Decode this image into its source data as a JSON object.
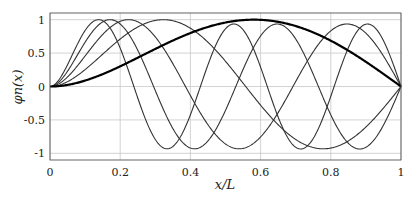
{
  "chart_data": {
    "type": "line",
    "title": "",
    "xlabel": "x/L",
    "ylabel": "φn(x)",
    "xlim": [
      0,
      1
    ],
    "ylim": [
      -1.1,
      1.1
    ],
    "xticks": [
      0,
      0.2,
      0.4,
      0.6,
      0.8,
      1
    ],
    "xtick_labels": [
      "0",
      "0.2",
      "0.4",
      "0.6",
      "0.8",
      "1"
    ],
    "yticks": [
      -1,
      -0.5,
      0,
      0.5,
      1
    ],
    "ytick_labels": [
      "-1",
      "-0.5",
      "0",
      "0.5",
      "1"
    ],
    "grid": true,
    "legend": null,
    "x": [
      0,
      0.1,
      0.2,
      0.3,
      0.4,
      0.5,
      0.6,
      0.7,
      0.8,
      0.9,
      1.0
    ],
    "series": [
      {
        "name": "mode 1",
        "beta": 3.9266,
        "bold": true,
        "values": [
          0,
          0.06,
          0.22,
          0.45,
          0.69,
          0.88,
          0.99,
          0.97,
          0.8,
          0.47,
          0
        ]
      },
      {
        "name": "mode 2",
        "beta": 7.0686,
        "bold": false,
        "values": [
          0,
          0.18,
          0.62,
          0.97,
          0.92,
          0.42,
          -0.29,
          -0.83,
          -0.97,
          -0.64,
          0
        ]
      },
      {
        "name": "mode 3",
        "beta": 10.2102,
        "bold": false,
        "values": [
          0,
          0.38,
          0.98,
          0.7,
          -0.25,
          -0.93,
          -0.75,
          0.1,
          0.86,
          0.82,
          0
        ]
      },
      {
        "name": "mode 4",
        "beta": 13.3518,
        "bold": false,
        "values": [
          0,
          0.6,
          0.93,
          -0.05,
          -0.93,
          -0.55,
          0.58,
          0.93,
          0.02,
          -0.9,
          0
        ]
      },
      {
        "name": "mode 5",
        "beta": 16.4934,
        "bold": false,
        "values": [
          0,
          0.82,
          0.55,
          -0.72,
          -0.8,
          0.55,
          0.92,
          -0.3,
          -0.97,
          0.05,
          0
        ]
      }
    ]
  }
}
